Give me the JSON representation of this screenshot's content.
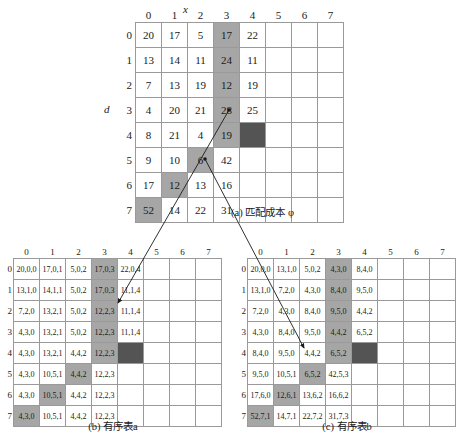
{
  "figure_a": {
    "caption": "(a) 匹配成本 φ",
    "axis_x_label": "x",
    "axis_d_label": "d",
    "col_headers": [
      "0",
      "1",
      "2",
      "3",
      "4",
      "5",
      "6",
      "7"
    ],
    "row_headers": [
      "0",
      "1",
      "2",
      "3",
      "4",
      "5",
      "6",
      "7"
    ],
    "rows": [
      [
        "20",
        "17",
        "5",
        "17",
        "22",
        "",
        "",
        ""
      ],
      [
        "13",
        "14",
        "11",
        "24",
        "11",
        "",
        "",
        ""
      ],
      [
        "7",
        "13",
        "19",
        "12",
        "19",
        "",
        "",
        ""
      ],
      [
        "4",
        "20",
        "21",
        "28",
        "25",
        "",
        "",
        ""
      ],
      [
        "8",
        "21",
        "4",
        "19",
        "",
        "",
        "",
        ""
      ],
      [
        "9",
        "10",
        "6",
        "42",
        "",
        "",
        "",
        ""
      ],
      [
        "17",
        "12",
        "13",
        "16",
        "",
        "",
        "",
        ""
      ],
      [
        "52",
        "14",
        "22",
        "31",
        "",
        "",
        "",
        ""
      ]
    ],
    "shaded_cells": [
      [
        0,
        3
      ],
      [
        1,
        3
      ],
      [
        2,
        3
      ],
      [
        3,
        3
      ],
      [
        4,
        3
      ],
      [
        5,
        2
      ],
      [
        6,
        1
      ],
      [
        7,
        0
      ]
    ],
    "dark_cells": [
      [
        4,
        4
      ]
    ]
  },
  "figure_b": {
    "caption": "(b) 有序表a",
    "col_headers": [
      "0",
      "1",
      "2",
      "3",
      "4",
      "5",
      "6",
      "7"
    ],
    "row_headers": [
      "0",
      "1",
      "2",
      "3",
      "4",
      "5",
      "6",
      "7"
    ],
    "rows": [
      [
        "20,0,0",
        "17,0,1",
        "5,0,2",
        "17,0,3",
        "22,0,4",
        "",
        "",
        ""
      ],
      [
        "13,1,0",
        "14,1,1",
        "5,0,2",
        "17,0,3",
        "11,1,4",
        "",
        "",
        ""
      ],
      [
        "7,2,0",
        "13,2,1",
        "5,0,2",
        "12,2,3",
        "11,1,4",
        "",
        "",
        ""
      ],
      [
        "4,3,0",
        "13,2,1",
        "5,0,2",
        "12,2,3",
        "11,1,4",
        "",
        "",
        ""
      ],
      [
        "4,3,0",
        "13,2,1",
        "4,4,2",
        "12,2,3",
        "",
        "",
        "",
        ""
      ],
      [
        "4,3,0",
        "10,5,1",
        "4,4,2",
        "12,2,3",
        "",
        "",
        "",
        ""
      ],
      [
        "4,3,0",
        "10,5,1",
        "4,4,2",
        "12,2,3",
        "",
        "",
        "",
        ""
      ],
      [
        "4,3,0",
        "10,5,1",
        "4,4,2",
        "12,2,3",
        "",
        "",
        "",
        ""
      ]
    ],
    "shaded_cells": [
      [
        0,
        3
      ],
      [
        1,
        3
      ],
      [
        2,
        3
      ],
      [
        3,
        3
      ],
      [
        4,
        3
      ],
      [
        5,
        2
      ],
      [
        6,
        1
      ],
      [
        7,
        0
      ]
    ],
    "dark_cells": [
      [
        4,
        4
      ]
    ]
  },
  "figure_c": {
    "caption": "(c) 有序表b",
    "col_headers": [
      "0",
      "1",
      "2",
      "3",
      "4",
      "5",
      "6",
      "7"
    ],
    "row_headers": [
      "0",
      "1",
      "2",
      "3",
      "4",
      "5",
      "6",
      "7"
    ],
    "rows": [
      [
        "20,0,0",
        "13,1,0",
        "5,0,2",
        "4,3,0",
        "8,4,0",
        "",
        "",
        ""
      ],
      [
        "13,1,0",
        "7,2,0",
        "4,3,0",
        "8,4,0",
        "9,5,0",
        "",
        "",
        ""
      ],
      [
        "7,2,0",
        "4,3,0",
        "8,4,0",
        "9,5,0",
        "4,4,2",
        "",
        "",
        ""
      ],
      [
        "4,3,0",
        "8,4,0",
        "9,5,0",
        "4,4,2",
        "6,5,2",
        "",
        "",
        ""
      ],
      [
        "8,4,0",
        "9,5,0",
        "4,4,2",
        "6,5,2",
        "",
        "",
        "",
        ""
      ],
      [
        "9,5,0",
        "10,5,1",
        "6,5,2",
        "42,5,3",
        "",
        "",
        "",
        ""
      ],
      [
        "17,6,0",
        "12,6,1",
        "13,6,2",
        "16,6,2",
        "",
        "",
        "",
        ""
      ],
      [
        "52,7,1",
        "14,7,1",
        "22,7,2",
        "31,7,3",
        "",
        "",
        "",
        ""
      ]
    ],
    "shaded_cells": [
      [
        0,
        3
      ],
      [
        1,
        3
      ],
      [
        2,
        3
      ],
      [
        3,
        3
      ],
      [
        4,
        3
      ],
      [
        5,
        2
      ],
      [
        6,
        1
      ],
      [
        7,
        0
      ]
    ],
    "dark_cells": [
      [
        4,
        4
      ]
    ]
  },
  "colors": {
    "shade": "#a6a6a6",
    "dark": "#545454",
    "grid_line": "#9a9a9a",
    "connector": "#1a1a1a"
  }
}
